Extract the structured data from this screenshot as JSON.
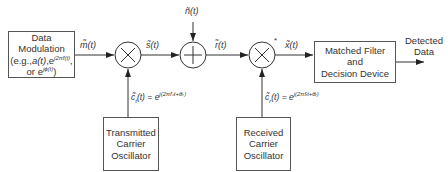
{
  "diagram": {
    "type": "block-diagram",
    "blocks": {
      "data_modulation": {
        "line1": "Data",
        "line2": "Modulation",
        "line3_prefix": "(e.g.,",
        "line3_a": "a(t)",
        "line3_sep": ",e",
        "line3_exp": "j2πf(t)",
        "line3_suffix": ",",
        "line4_prefix": "or e",
        "line4_exp": "jϕ(t)",
        "line4_suffix": ")"
      },
      "matched_filter": {
        "line1": "Matched Filter",
        "line2": "and",
        "line3": "Decision Device"
      },
      "transmitted_oscillator": {
        "line1": "Transmitted",
        "line2": "Carrier",
        "line3": "Oscillator"
      },
      "received_oscillator": {
        "line1": "Received",
        "line2": "Carrier",
        "line3": "Oscillator"
      }
    },
    "operators": {
      "mixer1": "×",
      "adder": "+",
      "mixer2": "×",
      "mixer2_conjugate_mark": "*"
    },
    "signals": {
      "m": "m̃(t)",
      "s": "s̃(t)",
      "n": "ñ(t)",
      "r": "r̃(t)",
      "x": "x̃(t)",
      "output_line1": "Detected",
      "output_line2": "Data",
      "ct_lhs": "c̃",
      "ct_sub": "t",
      "ct_arg": "(t) = e",
      "ct_exp": "j(2πfₜt+θₜ)",
      "cr_lhs": "c̃",
      "cr_sub": "r",
      "cr_arg": "(t) = e",
      "cr_exp": "j(2πfᵣt+θᵣ)"
    }
  }
}
